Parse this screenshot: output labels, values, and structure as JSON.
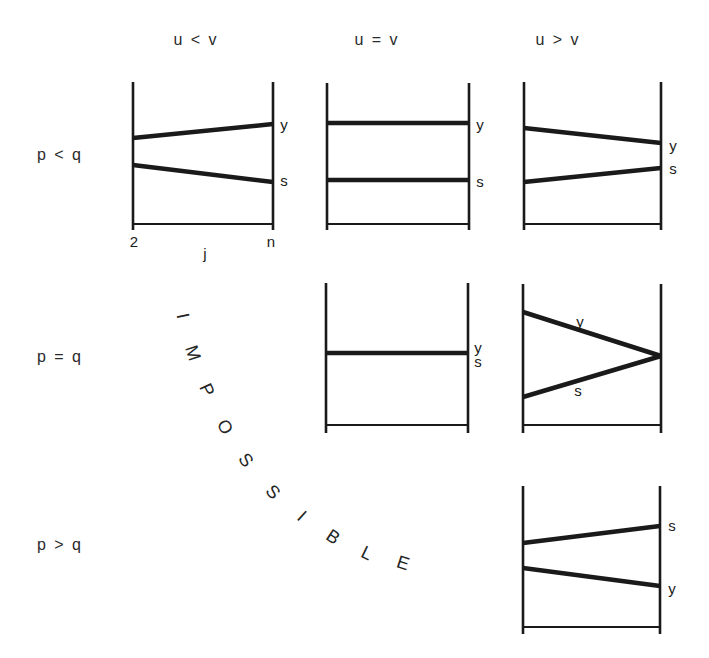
{
  "figure": {
    "background": "#ffffff",
    "ink": "#1a1a1a"
  },
  "column_headers": [
    {
      "label": "u < v"
    },
    {
      "label": "u = v"
    },
    {
      "label": "u > v"
    }
  ],
  "row_headers": [
    {
      "label": "p < q"
    },
    {
      "label": "p = q"
    },
    {
      "label": "p > q"
    }
  ],
  "impossible_text": {
    "word": "IMPOSSIBLE",
    "letters": [
      {
        "ch": "I",
        "x": 183,
        "y": 316,
        "rot": 78
      },
      {
        "ch": "M",
        "x": 193,
        "y": 353,
        "rot": 72
      },
      {
        "ch": "P",
        "x": 207,
        "y": 390,
        "rot": 65
      },
      {
        "ch": "O",
        "x": 225,
        "y": 427,
        "rot": 59
      },
      {
        "ch": "S",
        "x": 246,
        "y": 460,
        "rot": 52
      },
      {
        "ch": "S",
        "x": 273,
        "y": 492,
        "rot": 46
      },
      {
        "ch": "I",
        "x": 302,
        "y": 516,
        "rot": 42
      },
      {
        "ch": "B",
        "x": 333,
        "y": 537,
        "rot": 34
      },
      {
        "ch": "L",
        "x": 367,
        "y": 553,
        "rot": 26
      },
      {
        "ch": "E",
        "x": 403,
        "y": 563,
        "rot": 18
      }
    ]
  },
  "panels": [
    {
      "id": "p-lt-q--u-lt-v",
      "row": "p < q",
      "col": "u < v",
      "frame": {
        "left": 133,
        "right": 273,
        "top": 82,
        "bottom": 230,
        "axis_y": 224
      },
      "lines": [
        {
          "series": "y",
          "x1": 133,
          "y1": 138,
          "x2": 273,
          "y2": 124
        },
        {
          "series": "s",
          "x1": 133,
          "y1": 165,
          "x2": 273,
          "y2": 182
        }
      ],
      "labels": [
        {
          "text": "y",
          "x": 284,
          "y": 124
        },
        {
          "text": "s",
          "x": 284,
          "y": 180
        }
      ],
      "axis_labels": [
        {
          "text": "2",
          "x": 134,
          "y": 241
        },
        {
          "text": "j",
          "x": 205,
          "y": 253
        },
        {
          "text": "n",
          "x": 271,
          "y": 241
        }
      ]
    },
    {
      "id": "p-lt-q--u-eq-v",
      "row": "p < q",
      "col": "u = v",
      "frame": {
        "left": 327,
        "right": 469,
        "top": 83,
        "bottom": 230,
        "axis_y": 224
      },
      "lines": [
        {
          "series": "y",
          "x1": 327,
          "y1": 123,
          "x2": 469,
          "y2": 123
        },
        {
          "series": "s",
          "x1": 327,
          "y1": 180,
          "x2": 469,
          "y2": 180
        }
      ],
      "labels": [
        {
          "text": "y",
          "x": 480,
          "y": 124
        },
        {
          "text": "s",
          "x": 480,
          "y": 181
        }
      ],
      "axis_labels": []
    },
    {
      "id": "p-lt-q--u-gt-v",
      "row": "p < q",
      "col": "u > v",
      "frame": {
        "left": 524,
        "right": 661,
        "top": 82,
        "bottom": 230,
        "axis_y": 224
      },
      "lines": [
        {
          "series": "y",
          "x1": 524,
          "y1": 128,
          "x2": 661,
          "y2": 143
        },
        {
          "series": "s",
          "x1": 524,
          "y1": 182,
          "x2": 661,
          "y2": 168
        }
      ],
      "labels": [
        {
          "text": "y",
          "x": 673,
          "y": 145
        },
        {
          "text": "s",
          "x": 673,
          "y": 168
        }
      ],
      "axis_labels": []
    },
    {
      "id": "p-eq-q--u-eq-v",
      "row": "p = q",
      "col": "u = v",
      "frame": {
        "left": 326,
        "right": 468,
        "top": 283,
        "bottom": 433,
        "axis_y": 425
      },
      "lines": [
        {
          "series": "y+s",
          "x1": 326,
          "y1": 353,
          "x2": 468,
          "y2": 353
        }
      ],
      "labels": [
        {
          "text": "y",
          "x": 478,
          "y": 347
        },
        {
          "text": "s",
          "x": 478,
          "y": 361
        }
      ],
      "axis_labels": []
    },
    {
      "id": "p-eq-q--u-gt-v",
      "row": "p = q",
      "col": "u > v",
      "frame": {
        "left": 523,
        "right": 661,
        "top": 284,
        "bottom": 433,
        "axis_y": 425
      },
      "lines": [
        {
          "series": "y",
          "x1": 523,
          "y1": 312,
          "x2": 661,
          "y2": 356
        },
        {
          "series": "s",
          "x1": 523,
          "y1": 397,
          "x2": 661,
          "y2": 356
        }
      ],
      "labels": [
        {
          "text": "y",
          "x": 580,
          "y": 321
        },
        {
          "text": "s",
          "x": 578,
          "y": 390
        }
      ],
      "axis_labels": []
    },
    {
      "id": "p-gt-q--u-gt-v",
      "row": "p > q",
      "col": "u > v",
      "frame": {
        "left": 523,
        "right": 660,
        "top": 486,
        "bottom": 634,
        "axis_y": 627
      },
      "lines": [
        {
          "series": "s",
          "x1": 523,
          "y1": 543,
          "x2": 660,
          "y2": 526
        },
        {
          "series": "y",
          "x1": 523,
          "y1": 568,
          "x2": 660,
          "y2": 586
        }
      ],
      "labels": [
        {
          "text": "s",
          "x": 672,
          "y": 525
        },
        {
          "text": "y",
          "x": 672,
          "y": 588
        }
      ],
      "axis_labels": []
    }
  ]
}
